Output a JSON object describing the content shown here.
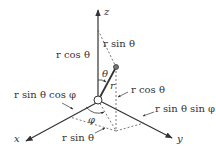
{
  "diagram": {
    "axes": {
      "x": "x",
      "y": "y",
      "z": "z"
    },
    "labels": {
      "r": "r",
      "theta": "θ",
      "phi": "φ",
      "r_cos_theta_axis": "r cos θ",
      "r_sin_theta_top": "r sin θ",
      "r_cos_theta_vertical": "r cos θ",
      "r_sin_theta_cos_phi": "r sin θ cos φ",
      "r_sin_theta_sin_phi": "r sin θ sin φ",
      "r_sin_theta_bottom": "r sin θ"
    },
    "colors": {
      "line": "#333333",
      "dashed": "#555555",
      "background": "#ffffff"
    }
  }
}
